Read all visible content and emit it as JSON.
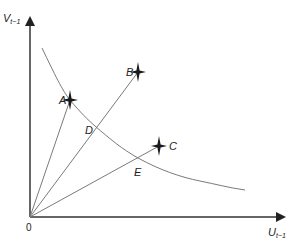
{
  "diagram": {
    "axes": {
      "x_label": "U",
      "x_label_sub": "t−1",
      "y_label": "V",
      "y_label_sub": "t−1",
      "origin_label": "0"
    },
    "points": [
      {
        "id": "A",
        "label": "A",
        "x": 70,
        "y": 100
      },
      {
        "id": "B",
        "label": "B",
        "x": 138,
        "y": 72
      },
      {
        "id": "C",
        "label": "C",
        "x": 159,
        "y": 146
      }
    ],
    "intersections": [
      {
        "id": "D",
        "label": "D",
        "x": 95,
        "y": 126
      },
      {
        "id": "E",
        "label": "E",
        "x": 138,
        "y": 158
      }
    ],
    "rays": [
      "0-A",
      "0-B",
      "0-C"
    ],
    "curve": "downward-sloping convex curve through A, D, E",
    "colors": {
      "axis": "#333333",
      "line": "#7a7a7a",
      "marker": "#1a1a1a"
    }
  }
}
